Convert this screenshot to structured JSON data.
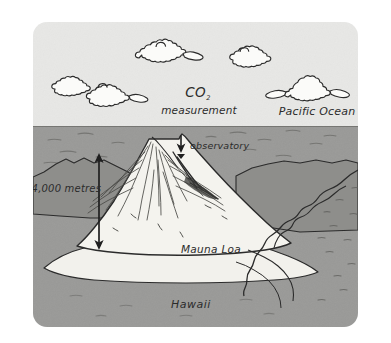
{
  "figure": {
    "style": "hand-drawn ink illustration",
    "canvas": {
      "width": 391,
      "height": 343
    },
    "frame": {
      "x": 33,
      "y": 22,
      "width": 325,
      "height": 305,
      "corner_radius": 14,
      "background": "#ffffff"
    }
  },
  "colors": {
    "page_background": "#ffffff",
    "sky": "#e8e8e6",
    "ocean": "#9a9a98",
    "land": "#9a9a98",
    "mountain": "#f2f1ec",
    "ink": "#2b2b2b",
    "ink_soft": "#555552",
    "texture": "#6e6e6c"
  },
  "regions": {
    "sky": {
      "label": "sky",
      "top": 22,
      "bottom": 126
    },
    "ocean": {
      "label": "ocean",
      "top": 126,
      "bottom": 327
    },
    "horizon_y": 126
  },
  "labels": {
    "co2": {
      "text": "CO",
      "subscript": "2"
    },
    "measurement": "measurement",
    "pacific_ocean": "Pacific Ocean",
    "observatory": "observatory",
    "elevation": ">4,000 metres",
    "mountain_name": "Mauna Loa",
    "island_name": "Hawaii"
  },
  "annotations": {
    "observatory_arrow": {
      "name": "observatory-pointer",
      "direction": "down",
      "from": {
        "x": 181,
        "y": 136
      },
      "to": {
        "x": 181,
        "y": 152
      }
    },
    "elevation_arrow": {
      "name": "elevation-double-arrow",
      "direction": "both",
      "top": {
        "x": 99,
        "y": 155
      },
      "bottom": {
        "x": 99,
        "y": 248
      }
    }
  },
  "clouds": [
    {
      "name": "cloud-upper-center",
      "x": 150,
      "y": 52
    },
    {
      "name": "cloud-upper-right",
      "x": 247,
      "y": 55
    },
    {
      "name": "cloud-left-small",
      "x": 72,
      "y": 84
    },
    {
      "name": "cloud-left-large",
      "x": 112,
      "y": 90
    },
    {
      "name": "cloud-right",
      "x": 300,
      "y": 85
    }
  ],
  "scene_elements": [
    {
      "name": "mountain-mauna-loa",
      "description": "large conical volcano rising from the ocean"
    },
    {
      "name": "background-ridge-left",
      "description": "lower dark ridge behind the left flank"
    },
    {
      "name": "coastline-right",
      "description": "wiggly island coastline on the right side"
    },
    {
      "name": "island-shore-base",
      "description": "pale shoreline at the foot of the mountain"
    }
  ]
}
